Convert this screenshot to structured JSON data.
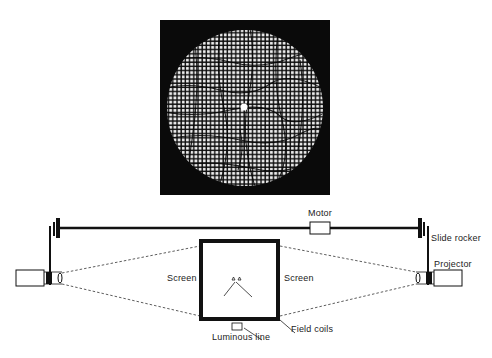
{
  "figure": {
    "photo": {
      "description": "Distorted grid pattern viewed through circular aperture",
      "background_color": "#0a0a0a",
      "grid_color": "#e8e8e8"
    },
    "labels": {
      "motor": "Motor",
      "slide_rocker": "Slide rocker",
      "projector": "Projector",
      "screen_left": "Screen",
      "screen_right": "Screen",
      "field_coils": "Field coils",
      "luminous_line": "Luminous line"
    },
    "colors": {
      "line": "#111111",
      "label": "#222222"
    }
  }
}
